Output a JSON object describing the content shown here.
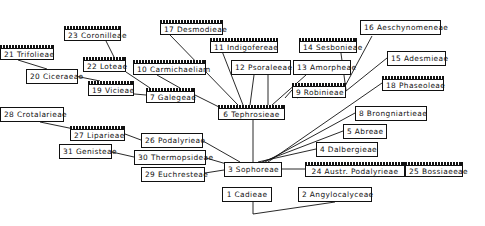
{
  "diagram": {
    "type": "tribal-relationship-network",
    "line_color": "#111111",
    "nodes": [
      {
        "id": 1,
        "label": "1 Cadieae",
        "x": 222,
        "y": 187,
        "w": 50,
        "ruled": false
      },
      {
        "id": 2,
        "label": "2 Angylocalyceae",
        "x": 298,
        "y": 187,
        "w": 74,
        "ruled": false
      },
      {
        "id": 3,
        "label": "3 Sophoreae",
        "x": 224,
        "y": 162,
        "w": 58,
        "ruled": false
      },
      {
        "id": 4,
        "label": "4 Dalbergieae",
        "x": 316,
        "y": 142,
        "w": 62,
        "ruled": false
      },
      {
        "id": 5,
        "label": "5 Abreae",
        "x": 343,
        "y": 124,
        "w": 44,
        "ruled": false
      },
      {
        "id": 6,
        "label": "6 Tephrosieae",
        "x": 218,
        "y": 105,
        "w": 67,
        "ruled": true
      },
      {
        "id": 7,
        "label": "7 Galegeae",
        "x": 146,
        "y": 88,
        "w": 49,
        "ruled": true
      },
      {
        "id": 8,
        "label": "8 Brongniartieae",
        "x": 355,
        "y": 106,
        "w": 72,
        "ruled": false
      },
      {
        "id": 9,
        "label": "9 Robinieae",
        "x": 292,
        "y": 83,
        "w": 54,
        "ruled": true
      },
      {
        "id": 10,
        "label": "10 Carmichaeliam",
        "x": 133,
        "y": 60,
        "w": 73,
        "ruled": true
      },
      {
        "id": 11,
        "label": "11 Indigofereae",
        "x": 210,
        "y": 38,
        "w": 68,
        "ruled": true
      },
      {
        "id": 12,
        "label": "12 Psoraleeae",
        "x": 231,
        "y": 60,
        "w": 60,
        "ruled": false
      },
      {
        "id": 13,
        "label": "13 Amorpheae",
        "x": 293,
        "y": 60,
        "w": 58,
        "ruled": false
      },
      {
        "id": 14,
        "label": "14 Sesbonieae",
        "x": 299,
        "y": 38,
        "w": 58,
        "ruled": true
      },
      {
        "id": 15,
        "label": "15 Adesmieae",
        "x": 387,
        "y": 51,
        "w": 59,
        "ruled": false
      },
      {
        "id": 16,
        "label": "16 Aeschynomeneae",
        "x": 360,
        "y": 20,
        "w": 81,
        "ruled": false
      },
      {
        "id": 17,
        "label": "17 Desmodieae",
        "x": 160,
        "y": 20,
        "w": 63,
        "ruled": true
      },
      {
        "id": 18,
        "label": "18 Phaseoleae",
        "x": 382,
        "y": 76,
        "w": 62,
        "ruled": true
      },
      {
        "id": 19,
        "label": "19 Vicieae",
        "x": 88,
        "y": 81,
        "w": 46,
        "ruled": true
      },
      {
        "id": 20,
        "label": "20 Ciceraeae",
        "x": 26,
        "y": 69,
        "w": 52,
        "ruled": false
      },
      {
        "id": 21,
        "label": "21 Trifolieae",
        "x": 0,
        "y": 45,
        "w": 54,
        "ruled": true
      },
      {
        "id": 22,
        "label": "22 Loteae",
        "x": 83,
        "y": 57,
        "w": 43,
        "ruled": true
      },
      {
        "id": 23,
        "label": "23 Coronilleae",
        "x": 64,
        "y": 26,
        "w": 57,
        "ruled": true
      },
      {
        "id": 24,
        "label": "24 Austr. Podalyrieae",
        "x": 305,
        "y": 162,
        "w": 100,
        "ruled": true
      },
      {
        "id": 25,
        "label": "25 Bossiaeeae",
        "x": 405,
        "y": 162,
        "w": 58,
        "ruled": true
      },
      {
        "id": 26,
        "label": "26 Podalyrieae",
        "x": 141,
        "y": 133,
        "w": 62,
        "ruled": false
      },
      {
        "id": 27,
        "label": "27 Liparieae",
        "x": 70,
        "y": 126,
        "w": 55,
        "ruled": true
      },
      {
        "id": 28,
        "label": "28 Crotalarieae",
        "x": 0,
        "y": 107,
        "w": 64,
        "ruled": false
      },
      {
        "id": 29,
        "label": "29 Euchresteae",
        "x": 141,
        "y": 167,
        "w": 64,
        "ruled": false
      },
      {
        "id": 30,
        "label": "30 Thermopsideae",
        "x": 134,
        "y": 150,
        "w": 72,
        "ruled": false
      },
      {
        "id": 31,
        "label": "31 Genisteae",
        "x": 59,
        "y": 144,
        "w": 53,
        "ruled": false
      }
    ],
    "edges": [
      [
        [
          253,
          214
        ],
        [
          253,
          202
        ]
      ],
      [
        [
          253,
          214
        ],
        [
          335,
          202
        ]
      ],
      [
        [
          253,
          177
        ],
        [
          253,
          120
        ]
      ],
      [
        [
          282,
          169
        ],
        [
          305,
          169
        ]
      ],
      [
        [
          405,
          169
        ],
        [
          420,
          169
        ]
      ],
      [
        [
          258,
          162
        ],
        [
          316,
          149
        ]
      ],
      [
        [
          262,
          162
        ],
        [
          343,
          131
        ]
      ],
      [
        [
          265,
          162
        ],
        [
          355,
          113
        ]
      ],
      [
        [
          268,
          162
        ],
        [
          382,
          83
        ]
      ],
      [
        [
          203,
          141
        ],
        [
          240,
          162
        ]
      ],
      [
        [
          206,
          158
        ],
        [
          230,
          165
        ]
      ],
      [
        [
          205,
          173
        ],
        [
          224,
          170
        ]
      ],
      [
        [
          125,
          134
        ],
        [
          141,
          140
        ]
      ],
      [
        [
          40,
          122
        ],
        [
          74,
          129
        ]
      ],
      [
        [
          112,
          152
        ],
        [
          134,
          157
        ]
      ],
      [
        [
          195,
          95
        ],
        [
          229,
          112
        ]
      ],
      [
        [
          100,
          91
        ],
        [
          146,
          95
        ]
      ],
      [
        [
          70,
          75
        ],
        [
          100,
          81
        ]
      ],
      [
        [
          18,
          60
        ],
        [
          47,
          69
        ]
      ],
      [
        [
          106,
          41
        ],
        [
          114,
          57
        ]
      ],
      [
        [
          126,
          72
        ],
        [
          150,
          88
        ]
      ],
      [
        [
          157,
          75
        ],
        [
          180,
          88
        ]
      ],
      [
        [
          170,
          35
        ],
        [
          238,
          105
        ]
      ],
      [
        [
          220,
          46
        ],
        [
          243,
          105
        ]
      ],
      [
        [
          254,
          75
        ],
        [
          250,
          105
        ]
      ],
      [
        [
          268,
          75
        ],
        [
          268,
          105
        ]
      ],
      [
        [
          306,
          75
        ],
        [
          272,
          105
        ]
      ],
      [
        [
          285,
          98
        ],
        [
          292,
          90
        ]
      ],
      [
        [
          297,
          98
        ],
        [
          312,
          90
        ]
      ],
      [
        [
          340,
          46
        ],
        [
          346,
          90
        ]
      ],
      [
        [
          372,
          36
        ],
        [
          344,
          88
        ]
      ],
      [
        [
          387,
          58
        ],
        [
          346,
          91
        ]
      ]
    ]
  }
}
